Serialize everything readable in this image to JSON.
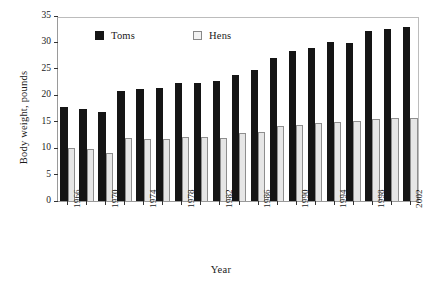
{
  "chart_data": {
    "type": "bar",
    "title": "",
    "xlabel": "Year",
    "ylabel": "Body weight, pounds",
    "ylim": [
      0,
      35
    ],
    "yticks": [
      0,
      5,
      10,
      15,
      20,
      25,
      30,
      35
    ],
    "ytick_labels": [
      "0",
      "5",
      "10",
      "15",
      "20",
      "25",
      "30",
      "35"
    ],
    "grid": false,
    "legend_position": "top-center-inside",
    "categories": [
      1966,
      1968,
      1970,
      1972,
      1974,
      1976,
      1978,
      1980,
      1982,
      1984,
      1986,
      1988,
      1990,
      1992,
      1994,
      1996,
      1998,
      2000,
      2002
    ],
    "xtick_labels": [
      "1966",
      "1970",
      "1974",
      "1978",
      "1982",
      "1986",
      "1990",
      "1994",
      "1998",
      "2002"
    ],
    "xtick_categories": [
      1966,
      1970,
      1974,
      1978,
      1982,
      1986,
      1990,
      1994,
      1998,
      2002
    ],
    "series": [
      {
        "name": "Toms",
        "color": "#151515",
        "values": [
          17.7,
          17.5,
          16.9,
          20.8,
          21.2,
          21.3,
          22.3,
          22.3,
          22.8,
          23.9,
          24.7,
          27.1,
          28.3,
          28.9,
          30.0,
          29.9,
          32.1,
          32.5,
          33.0
        ]
      },
      {
        "name": "Hens",
        "color": "#e6e6e6",
        "values": [
          10.0,
          9.9,
          9.0,
          11.9,
          11.8,
          11.8,
          12.2,
          12.2,
          11.9,
          12.9,
          13.0,
          14.2,
          14.4,
          14.8,
          15.0,
          15.1,
          15.5,
          15.7,
          15.8
        ]
      }
    ]
  }
}
